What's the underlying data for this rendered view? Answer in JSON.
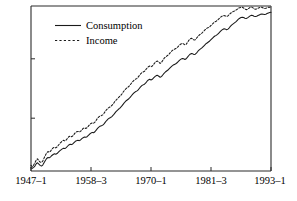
{
  "chart_data": {
    "type": "line",
    "title": "",
    "subtitle": "",
    "xlabel": "",
    "ylabel": "",
    "grid": false,
    "legend_position": "top-left",
    "xlim": [
      0,
      184
    ],
    "ylim": [
      0,
      100
    ],
    "x_tick_positions": [
      0,
      46,
      92,
      138,
      184
    ],
    "xticklabels": [
      "1947–1",
      "1958–3",
      "1970–1",
      "1981–3",
      "1993–1"
    ],
    "yticklabels": [],
    "y_tick_positions": [
      32,
      68
    ],
    "x_note": "quarterly index, 1947Q1 = 0 through 1993Q1 = 184",
    "series": [
      {
        "name": "Consumption",
        "style": "solid",
        "color": "#1a1a1a",
        "values": [
          2.0,
          1.6,
          2.2,
          3.0,
          4.4,
          5.0,
          4.2,
          3.4,
          3.0,
          3.6,
          5.0,
          6.4,
          7.6,
          8.2,
          8.0,
          8.6,
          9.4,
          10.0,
          10.4,
          10.2,
          10.6,
          11.4,
          12.2,
          12.8,
          13.4,
          13.8,
          13.6,
          14.2,
          15.0,
          15.8,
          16.2,
          16.0,
          16.4,
          17.2,
          18.0,
          18.4,
          18.6,
          18.4,
          18.8,
          19.6,
          20.2,
          20.6,
          20.4,
          20.8,
          21.6,
          22.4,
          23.0,
          23.4,
          23.2,
          23.8,
          24.8,
          25.8,
          26.6,
          27.2,
          27.4,
          27.8,
          28.6,
          29.6,
          30.6,
          31.4,
          32.0,
          32.4,
          33.0,
          33.8,
          34.8,
          35.8,
          36.6,
          37.4,
          38.0,
          38.8,
          39.8,
          40.8,
          41.8,
          42.6,
          43.2,
          43.8,
          44.6,
          45.6,
          46.6,
          47.4,
          48.0,
          48.4,
          49.0,
          50.0,
          51.0,
          51.8,
          52.2,
          52.6,
          53.4,
          54.4,
          55.2,
          55.6,
          55.2,
          55.6,
          56.4,
          57.2,
          57.8,
          58.0,
          57.4,
          56.8,
          57.2,
          58.2,
          59.2,
          60.0,
          60.6,
          61.2,
          62.0,
          62.8,
          63.6,
          64.2,
          64.6,
          65.0,
          65.6,
          66.4,
          67.2,
          67.8,
          68.2,
          68.0,
          67.6,
          68.0,
          69.0,
          70.0,
          70.8,
          71.2,
          71.0,
          70.6,
          70.8,
          71.6,
          72.6,
          73.4,
          74.0,
          74.6,
          75.4,
          76.2,
          77.0,
          77.6,
          78.2,
          78.8,
          79.6,
          80.4,
          81.2,
          81.8,
          82.2,
          82.8,
          83.6,
          84.4,
          85.2,
          85.8,
          86.2,
          86.0,
          85.6,
          86.0,
          86.8,
          87.8,
          88.6,
          89.2,
          89.8,
          90.4,
          91.2,
          92.0,
          92.6,
          93.0,
          93.2,
          93.0,
          92.6,
          92.4,
          92.8,
          93.4,
          94.0,
          94.4,
          94.2,
          93.8,
          93.6,
          93.8,
          94.2,
          94.6,
          95.0,
          95.2,
          95.0,
          94.8,
          95.0,
          95.4,
          95.8,
          96.0,
          96.2
        ]
      },
      {
        "name": "Income",
        "style": "dotted",
        "color": "#1a1a1a",
        "values": [
          3.4,
          2.6,
          3.6,
          5.0,
          6.6,
          7.4,
          6.2,
          5.4,
          5.2,
          6.0,
          7.8,
          9.4,
          11.0,
          11.8,
          11.4,
          12.0,
          13.2,
          14.0,
          14.4,
          14.0,
          14.6,
          15.6,
          16.6,
          17.4,
          18.2,
          18.6,
          18.2,
          18.8,
          19.8,
          20.8,
          21.2,
          20.8,
          21.2,
          22.2,
          23.2,
          23.8,
          24.0,
          23.6,
          24.0,
          25.0,
          25.8,
          26.2,
          25.8,
          26.2,
          27.2,
          28.2,
          28.8,
          29.2,
          29.0,
          29.6,
          30.8,
          32.0,
          32.8,
          33.4,
          33.6,
          34.0,
          35.0,
          36.2,
          37.2,
          38.0,
          38.6,
          39.0,
          39.8,
          40.6,
          41.8,
          42.8,
          43.6,
          44.4,
          45.2,
          46.0,
          47.0,
          48.2,
          49.2,
          50.0,
          50.6,
          51.2,
          52.2,
          53.2,
          54.2,
          55.0,
          55.6,
          56.0,
          56.8,
          57.8,
          58.8,
          59.6,
          60.0,
          60.4,
          61.4,
          62.4,
          63.2,
          63.6,
          63.2,
          63.6,
          64.6,
          65.6,
          66.4,
          66.6,
          66.0,
          65.2,
          65.8,
          67.0,
          68.2,
          69.0,
          69.6,
          70.2,
          71.0,
          72.0,
          72.8,
          73.4,
          73.8,
          74.2,
          74.8,
          75.6,
          76.4,
          77.0,
          77.4,
          77.0,
          76.4,
          76.8,
          78.0,
          79.2,
          80.0,
          80.4,
          80.0,
          79.4,
          79.6,
          80.6,
          81.6,
          82.4,
          83.0,
          83.6,
          84.4,
          85.2,
          86.0,
          86.6,
          87.0,
          87.4,
          88.2,
          89.0,
          89.8,
          90.4,
          90.8,
          91.4,
          92.2,
          93.0,
          93.6,
          94.0,
          94.2,
          94.0,
          93.6,
          94.0,
          94.8,
          95.6,
          96.2,
          96.6,
          97.0,
          97.4,
          98.0,
          98.6,
          99.0,
          99.2,
          99.2,
          98.8,
          98.2,
          97.8,
          98.0,
          98.6,
          99.2,
          99.4,
          99.0,
          98.4,
          98.0,
          98.2,
          98.6,
          99.0,
          99.2,
          99.2,
          98.8,
          98.4,
          98.6,
          99.0,
          99.2,
          99.2,
          99.0
        ]
      }
    ]
  },
  "legend": {
    "items": [
      {
        "label": "Consumption",
        "style": "solid"
      },
      {
        "label": "Income",
        "style": "dotted"
      }
    ]
  },
  "axis": {
    "xticklabels": [
      "1947–1",
      "1958–3",
      "1970–1",
      "1981–3",
      "1993–1"
    ]
  }
}
